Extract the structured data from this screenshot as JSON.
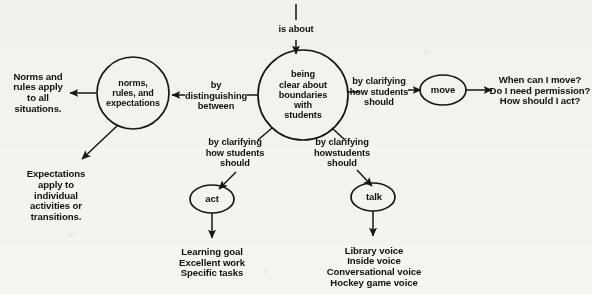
{
  "diagram": {
    "stroke_color": "#161616",
    "background_color": "#f6f4ef",
    "text_color": "#111111"
  },
  "nodes": {
    "central": "being\nclear about\nboundaries\nwith\nstudents",
    "norms_circle": "norms,\nrules, and\nexpectations",
    "move_ellipse": "move",
    "act_ellipse": "act",
    "talk_ellipse": "talk"
  },
  "edge_labels": {
    "is_about": "is about",
    "distinguishing": "by\ndistinguishing\nbetween",
    "clarifying_right": "by clarifying\nhow students\nshould",
    "clarifying_left_bottom": "by clarifying\nhow students\nshould",
    "clarifying_right_bottom": "by clarifying\nhowstudents\nshould"
  },
  "leaves": {
    "norms_apply": "Norms and\nrules apply\nto all\nsituations.",
    "expectations_apply": "Expectations\napply to\nindividual\nactivities or\ntransitions.",
    "move_questions": "When can I move?\nDo I need permission?\nHow should I act?",
    "act_items": "Learning goal\nExcellent work\nSpecific tasks",
    "talk_items": "Library voice\nInside voice\nConversational voice\nHockey game voice"
  }
}
